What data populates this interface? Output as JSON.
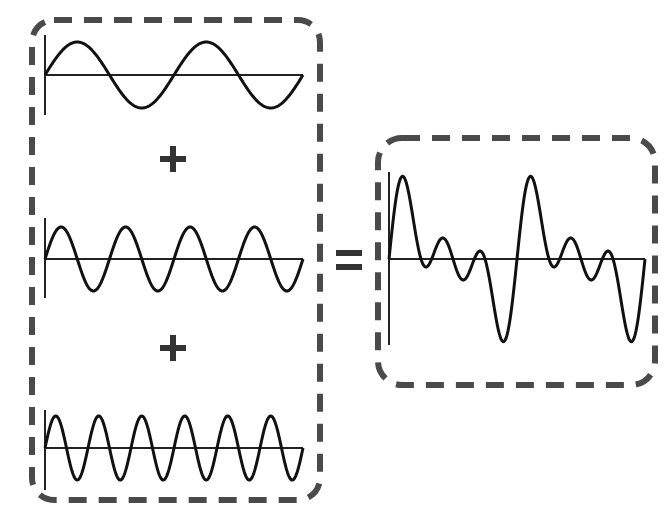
{
  "components": [
    {
      "name": "fundamental",
      "cycles": 2,
      "amplitude": 1,
      "frequency_multiple": 1
    },
    {
      "name": "second-harmonic",
      "cycles": 4,
      "amplitude": 1,
      "frequency_multiple": 2
    },
    {
      "name": "third-harmonic",
      "cycles": 6,
      "amplitude": 1,
      "frequency_multiple": 3
    }
  ],
  "operators": {
    "plus": "+",
    "equals": "="
  },
  "result": {
    "name": "composite-wave",
    "description": "Sum of the three component waves",
    "repetitions": 2
  },
  "colors": {
    "stroke": "#111111",
    "box": "#4a4a4a"
  }
}
